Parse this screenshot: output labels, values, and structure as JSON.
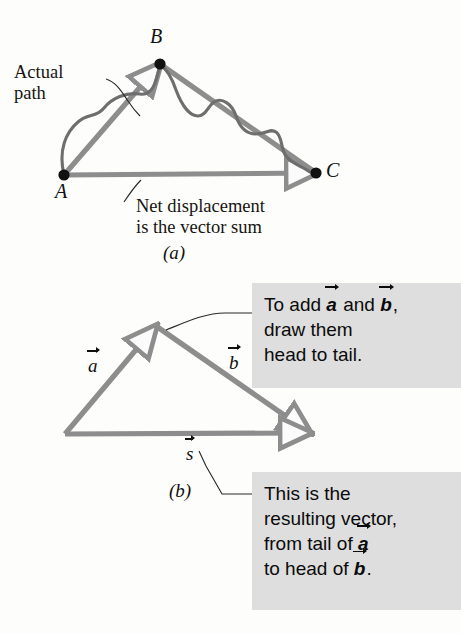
{
  "figure": {
    "background_color": "#fdfdfc",
    "vector_color": "#8d8d8d",
    "vector_dark_color": "#7a7a7a",
    "path_color": "#6e6e6e",
    "leader_color": "#2b2b2b",
    "point_color": "#111111",
    "callout_bg": "#dedede",
    "text_color": "#111111"
  },
  "panel_a": {
    "label": "(a)",
    "label_pos": {
      "x": 163,
      "y": 243
    },
    "points": [
      {
        "name": "A",
        "label": "A",
        "x": 64,
        "y": 175,
        "label_x": 55,
        "label_y": 181
      },
      {
        "name": "B",
        "label": "B",
        "x": 160,
        "y": 64,
        "label_x": 150,
        "label_y": 26
      },
      {
        "name": "C",
        "label": "C",
        "x": 316,
        "y": 173,
        "label_x": 326,
        "label_y": 160
      }
    ],
    "vectors": [
      {
        "name": "A-to-B",
        "from": [
          64,
          175
        ],
        "to": [
          160,
          64
        ]
      },
      {
        "name": "B-to-C",
        "from": [
          160,
          64
        ],
        "to": [
          316,
          173
        ]
      },
      {
        "name": "A-to-C",
        "from": [
          64,
          175
        ],
        "to": [
          316,
          173
        ]
      }
    ],
    "actual_path": "M 64,175 C 58,150 66,132 78,122 C 88,113 96,118 104,108 C 112,98 126,92 140,94 C 152,96 156,84 160,64 C 168,70 172,78 176,90 C 182,106 190,116 198,116 C 206,116 208,106 214,102 C 222,97 232,104 236,116 C 240,128 246,134 256,134 C 266,134 270,128 276,132 C 283,137 280,148 286,156 C 292,164 302,166 310,172",
    "annotations": [
      {
        "name": "actual-path-note",
        "lines": [
          "Actual",
          "path"
        ],
        "x": 14,
        "y": 62,
        "align": "left",
        "leader": "M 106,79 C 116,82 122,92 128,101 C 132,107 136,112 140,116"
      },
      {
        "name": "net-displacement-note",
        "lines": [
          "Net displacement",
          "is the vector sum"
        ],
        "x": 136,
        "y": 196,
        "align": "left",
        "leader": "M 141,180 C 134,187 128,196 124,202"
      }
    ]
  },
  "panel_b": {
    "label": "(b)",
    "label_pos": {
      "x": 169,
      "y": 481
    },
    "triangle": {
      "tail": [
        65,
        434
      ],
      "apex": [
        156,
        326
      ],
      "head": [
        310,
        433
      ]
    },
    "vectors": [
      {
        "name": "vector-a",
        "symbol": "a",
        "from": [
          65,
          434
        ],
        "to": [
          156,
          326
        ],
        "label_x": 88,
        "label_y": 355
      },
      {
        "name": "vector-b",
        "symbol": "b",
        "from": [
          156,
          326
        ],
        "to": [
          310,
          433
        ],
        "label_x": 229,
        "label_y": 352
      },
      {
        "name": "vector-s",
        "symbol": "s",
        "from": [
          65,
          434
        ],
        "to": [
          310,
          433
        ],
        "label_x": 186,
        "label_y": 443
      }
    ],
    "callouts": [
      {
        "name": "add-vectors-callout",
        "x": 252,
        "y": 283,
        "width": 209,
        "height": 105,
        "lines": [
          {
            "segments": [
              {
                "t": "To add "
              },
              {
                "v": "a"
              },
              {
                "t": " and "
              },
              {
                "v": "b"
              },
              {
                "t": ","
              }
            ]
          },
          {
            "segments": [
              {
                "t": "draw them"
              }
            ]
          },
          {
            "segments": [
              {
                "t": "head to tail."
              }
            ]
          }
        ],
        "leader": "M 252,313 L 225,313 C 205,313 186,322 166,330"
      },
      {
        "name": "resulting-vector-callout",
        "x": 252,
        "y": 472,
        "width": 209,
        "height": 138,
        "lines": [
          {
            "segments": [
              {
                "t": "This is the"
              }
            ]
          },
          {
            "segments": [
              {
                "t": "resulting vector,"
              }
            ]
          },
          {
            "segments": [
              {
                "t": "from tail of "
              },
              {
                "v": "a"
              }
            ]
          },
          {
            "segments": [
              {
                "t": "to head of "
              },
              {
                "v": "b"
              },
              {
                "t": "."
              }
            ]
          }
        ],
        "leader": "M 252,494 L 222,494 L 206,466 L 199,451"
      }
    ]
  }
}
